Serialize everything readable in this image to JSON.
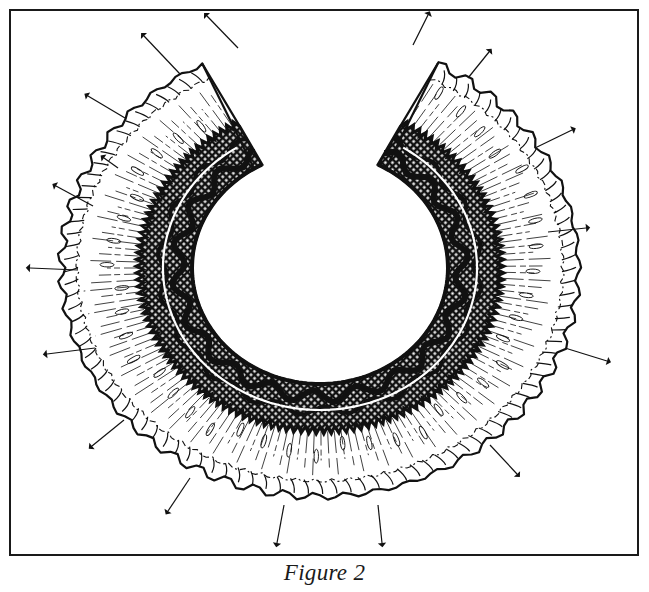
{
  "figure": {
    "caption": "Figure 2",
    "colors": {
      "ink": "#111111",
      "paper": "#ffffff",
      "frame": "#1a1a1a"
    },
    "pin_count": 17
  }
}
